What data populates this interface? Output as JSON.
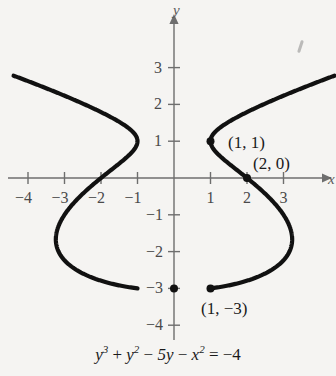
{
  "figure": {
    "background_color": "#f5f4f2",
    "curve_color": "#111111",
    "axis_color": "#6e6e6e"
  },
  "axes": {
    "x_axis_name": "x",
    "y_axis_name": "y",
    "x_ticks": [
      {
        "value": -4,
        "label": "−4"
      },
      {
        "value": -3,
        "label": "−3"
      },
      {
        "value": -2,
        "label": "−2"
      },
      {
        "value": -1,
        "label": "−1"
      },
      {
        "value": 1,
        "label": "1"
      },
      {
        "value": 2,
        "label": "2"
      },
      {
        "value": 3,
        "label": "3"
      }
    ],
    "y_ticks": [
      {
        "value": 3,
        "label": "3"
      },
      {
        "value": 2,
        "label": "2"
      },
      {
        "value": 1,
        "label": "1"
      },
      {
        "value": -1,
        "label": "−1"
      },
      {
        "value": -2,
        "label": "−2"
      },
      {
        "value": -3,
        "label": "−3"
      },
      {
        "value": -4,
        "label": "−4"
      }
    ]
  },
  "annotations": [
    {
      "name": "point-label-1-1",
      "text": "(1, 1)",
      "x": 228,
      "y": 134
    },
    {
      "name": "point-label-2-0",
      "text": "(2, 0)",
      "x": 253,
      "y": 155
    },
    {
      "name": "point-label-1-neg3",
      "text": "(1, −3)",
      "x": 201,
      "y": 300
    }
  ],
  "marked_points": [
    {
      "name": "marked-point-1-1",
      "x": 1,
      "y": 1
    },
    {
      "name": "marked-point-2-0",
      "x": 2,
      "y": 0
    },
    {
      "name": "marked-point-0-neg3",
      "x": 0,
      "y": -3
    },
    {
      "name": "marked-point-1-neg3",
      "x": 1,
      "y": -3
    }
  ],
  "equation": {
    "parts": [
      {
        "type": "var",
        "text": "y"
      },
      {
        "type": "sup",
        "text": "3"
      },
      {
        "type": "op",
        "text": " + "
      },
      {
        "type": "var",
        "text": "y"
      },
      {
        "type": "sup",
        "text": "2"
      },
      {
        "type": "op",
        "text": " − "
      },
      {
        "type": "var",
        "text": "5y"
      },
      {
        "type": "op",
        "text": " − "
      },
      {
        "type": "var",
        "text": "x"
      },
      {
        "type": "sup",
        "text": "2"
      },
      {
        "type": "op",
        "text": " = −4"
      }
    ],
    "plain": "y^3 + y^2 - 5y - x^2 = -4"
  },
  "chart_data": {
    "type": "line",
    "title": "",
    "xlabel": "x",
    "ylabel": "y",
    "xlim": [
      -4.6,
      4.3
    ],
    "ylim": [
      -4.5,
      3.5
    ],
    "grid": false,
    "legend": "none",
    "equation": "y^3 + y^2 - 5y - x^2 = -4",
    "relation": "x = ± sqrt(y^3 + y^2 - 5y + 4)",
    "annotated_points": [
      {
        "label": "(1, 1)",
        "x": 1,
        "y": 1
      },
      {
        "label": "(2, 0)",
        "x": 2,
        "y": 0
      },
      {
        "label": "(1, −3)",
        "x": 1,
        "y": -3
      }
    ],
    "features": {
      "cusps": [
        [
          -1,
          1
        ],
        [
          1,
          1
        ]
      ],
      "x_intercepts_on_axis": [
        -2,
        0,
        2
      ],
      "lowest_point_y": -3,
      "widest_x_extent": [
        -3.3,
        3.3
      ],
      "widest_x_at_y": -2.0
    },
    "series": [
      {
        "name": "right branch (x > 0)",
        "points": [
          [
            3.0,
            2.75
          ],
          [
            2.62,
            2.4
          ],
          [
            2.26,
            2.0
          ],
          [
            1.95,
            1.6
          ],
          [
            1.66,
            1.2
          ],
          [
            1.55,
            1.0
          ],
          [
            1.35,
            0.7
          ],
          [
            1.18,
            0.4
          ],
          [
            2.0,
            0.0
          ],
          [
            2.29,
            -0.4
          ],
          [
            2.55,
            -0.8
          ],
          [
            2.78,
            -1.2
          ],
          [
            2.98,
            -1.6
          ],
          [
            3.14,
            -2.0
          ],
          [
            3.25,
            -2.4
          ],
          [
            3.25,
            -2.7
          ],
          [
            3.0,
            -2.9
          ],
          [
            2.4,
            -2.98
          ],
          [
            1.6,
            -3.0
          ],
          [
            0.9,
            -3.0
          ],
          [
            0.0,
            -3.0
          ]
        ]
      },
      {
        "name": "left branch (x < 0)",
        "points": [
          [
            -3.0,
            2.75
          ],
          [
            -2.62,
            2.4
          ],
          [
            -2.26,
            2.0
          ],
          [
            -1.95,
            1.6
          ],
          [
            -1.66,
            1.2
          ],
          [
            -1.55,
            1.0
          ],
          [
            -1.35,
            0.7
          ],
          [
            -1.18,
            0.4
          ],
          [
            -2.0,
            0.0
          ],
          [
            -2.29,
            -0.4
          ],
          [
            -2.55,
            -0.8
          ],
          [
            -2.78,
            -1.2
          ],
          [
            -2.98,
            -1.6
          ],
          [
            -3.14,
            -2.0
          ],
          [
            -3.25,
            -2.4
          ],
          [
            -3.25,
            -2.7
          ],
          [
            -3.0,
            -2.9
          ],
          [
            -2.4,
            -2.98
          ],
          [
            -1.6,
            -3.0
          ],
          [
            -0.9,
            -3.0
          ],
          [
            0.0,
            -3.0
          ]
        ]
      }
    ]
  }
}
